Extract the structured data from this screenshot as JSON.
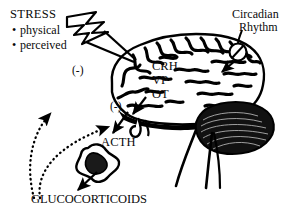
{
  "figure": {
    "background_color": "#ffffff",
    "ink_color": "#000000"
  },
  "labels": {
    "stress_title": "STRESS",
    "stress_items": [
      {
        "bullet": "•",
        "text": "physical"
      },
      {
        "bullet": "•",
        "text": "perceived"
      }
    ],
    "circadian_line1": "Circadian",
    "circadian_line2": "Rhythm",
    "peptides": [
      "CRH",
      "VP",
      "OT"
    ],
    "inhibition_brain": "(-)",
    "inhibition_pituitary": "(-)",
    "acth": "ACTH",
    "glucocorticoids": "GLUCOCORTICOIDS"
  },
  "icons": {
    "lightning": "lightning-bolt-icon",
    "oscillator": "circadian-oscillator-icon",
    "brain": "brain-icon",
    "adrenal": "adrenal-gland-icon"
  }
}
